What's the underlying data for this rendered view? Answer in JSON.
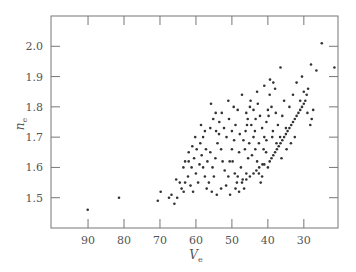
{
  "chart_data": {
    "type": "scatter",
    "title": "",
    "xlabel": "V",
    "xlabel_subscript": "e",
    "ylabel": "n",
    "ylabel_subscript": "e",
    "x_reversed": true,
    "xlim": [
      100.3,
      20.5
    ],
    "ylim": [
      1.4,
      2.1
    ],
    "x_ticks": [
      90,
      80,
      70,
      60,
      50,
      40,
      30
    ],
    "x_tick_labels": [
      "90",
      "80",
      "70",
      "60",
      "50",
      "40",
      "30"
    ],
    "y_ticks": [
      1.5,
      1.6,
      1.7,
      1.8,
      1.9,
      2.0
    ],
    "y_tick_labels": [
      "1.5",
      "1.6",
      "1.7",
      "1.8",
      "1.9",
      "2.0"
    ],
    "grid": false,
    "legend": null,
    "series": [
      {
        "name": "glasses",
        "marker_color": "#333333",
        "points": [
          [
            90.1,
            1.46
          ],
          [
            81.4,
            1.5
          ],
          [
            70.6,
            1.49
          ],
          [
            69.8,
            1.52
          ],
          [
            67.5,
            1.5
          ],
          [
            66.8,
            1.51
          ],
          [
            66.0,
            1.48
          ],
          [
            65.2,
            1.5
          ],
          [
            64.0,
            1.53
          ],
          [
            63.4,
            1.52
          ],
          [
            65.5,
            1.56
          ],
          [
            64.5,
            1.55
          ],
          [
            63.0,
            1.55
          ],
          [
            62.2,
            1.57
          ],
          [
            61.5,
            1.54
          ],
          [
            60.8,
            1.52
          ],
          [
            63.0,
            1.62
          ],
          [
            62.0,
            1.62
          ],
          [
            61.2,
            1.6
          ],
          [
            60.5,
            1.63
          ],
          [
            60.0,
            1.58
          ],
          [
            59.4,
            1.55
          ],
          [
            59.0,
            1.61
          ],
          [
            58.4,
            1.64
          ],
          [
            58.0,
            1.6
          ],
          [
            57.5,
            1.57
          ],
          [
            57.0,
            1.53
          ],
          [
            56.4,
            1.55
          ],
          [
            59.8,
            1.66
          ],
          [
            58.8,
            1.68
          ],
          [
            58.0,
            1.7
          ],
          [
            57.2,
            1.66
          ],
          [
            56.8,
            1.62
          ],
          [
            56.0,
            1.65
          ],
          [
            55.4,
            1.6
          ],
          [
            55.0,
            1.57
          ],
          [
            54.6,
            1.63
          ],
          [
            54.0,
            1.68
          ],
          [
            53.6,
            1.71
          ],
          [
            53.0,
            1.66
          ],
          [
            52.6,
            1.62
          ],
          [
            52.0,
            1.59
          ],
          [
            51.6,
            1.54
          ],
          [
            51.0,
            1.57
          ],
          [
            50.6,
            1.62
          ],
          [
            50.0,
            1.66
          ],
          [
            56.0,
            1.73
          ],
          [
            55.2,
            1.76
          ],
          [
            54.4,
            1.72
          ],
          [
            53.5,
            1.75
          ],
          [
            52.8,
            1.78
          ],
          [
            52.2,
            1.73
          ],
          [
            51.5,
            1.7
          ],
          [
            50.8,
            1.76
          ],
          [
            50.0,
            1.72
          ],
          [
            49.4,
            1.69
          ],
          [
            49.0,
            1.74
          ],
          [
            48.4,
            1.79
          ],
          [
            48.0,
            1.65
          ],
          [
            47.5,
            1.6
          ],
          [
            47.0,
            1.56
          ],
          [
            46.6,
            1.53
          ],
          [
            46.0,
            1.58
          ],
          [
            45.5,
            1.63
          ],
          [
            49.8,
            1.62
          ],
          [
            49.2,
            1.58
          ],
          [
            48.6,
            1.55
          ],
          [
            48.0,
            1.52
          ],
          [
            47.2,
            1.55
          ],
          [
            46.8,
            1.69
          ],
          [
            46.2,
            1.72
          ],
          [
            45.6,
            1.76
          ],
          [
            45.0,
            1.8
          ],
          [
            44.6,
            1.74
          ],
          [
            44.0,
            1.7
          ],
          [
            43.5,
            1.66
          ],
          [
            43.0,
            1.62
          ],
          [
            42.5,
            1.58
          ],
          [
            42.0,
            1.55
          ],
          [
            41.6,
            1.57
          ],
          [
            41.0,
            1.61
          ],
          [
            40.5,
            1.65
          ],
          [
            44.8,
            1.82
          ],
          [
            44.0,
            1.79
          ],
          [
            43.4,
            1.76
          ],
          [
            42.8,
            1.81
          ],
          [
            42.2,
            1.77
          ],
          [
            41.6,
            1.73
          ],
          [
            41.0,
            1.7
          ],
          [
            40.4,
            1.75
          ],
          [
            40.0,
            1.79
          ],
          [
            39.5,
            1.84
          ],
          [
            39.0,
            1.8
          ],
          [
            38.6,
            1.72
          ],
          [
            43.0,
            1.85
          ],
          [
            41.0,
            1.87
          ],
          [
            39.4,
            1.89
          ],
          [
            38.0,
            1.86
          ],
          [
            36.5,
            1.93
          ],
          [
            38.5,
            1.88
          ],
          [
            37.8,
            1.78
          ],
          [
            37.2,
            1.74
          ],
          [
            36.6,
            1.7
          ],
          [
            36.0,
            1.77
          ],
          [
            35.5,
            1.82
          ],
          [
            35.0,
            1.73
          ],
          [
            40.0,
            1.6
          ],
          [
            39.5,
            1.62
          ],
          [
            39.0,
            1.63
          ],
          [
            38.5,
            1.64
          ],
          [
            38.0,
            1.65
          ],
          [
            37.5,
            1.66
          ],
          [
            37.0,
            1.67
          ],
          [
            36.5,
            1.68
          ],
          [
            36.0,
            1.69
          ],
          [
            35.5,
            1.7
          ],
          [
            35.0,
            1.71
          ],
          [
            34.5,
            1.72
          ],
          [
            34.0,
            1.73
          ],
          [
            33.5,
            1.74
          ],
          [
            33.0,
            1.75
          ],
          [
            32.5,
            1.76
          ],
          [
            32.0,
            1.77
          ],
          [
            31.5,
            1.78
          ],
          [
            31.0,
            1.79
          ],
          [
            30.5,
            1.8
          ],
          [
            30.0,
            1.81
          ],
          [
            29.6,
            1.82
          ],
          [
            29.2,
            1.84
          ],
          [
            28.8,
            1.86
          ],
          [
            44.0,
            1.58
          ],
          [
            43.2,
            1.59
          ],
          [
            42.4,
            1.6
          ],
          [
            41.5,
            1.61
          ],
          [
            45.0,
            1.57
          ],
          [
            46.0,
            1.56
          ],
          [
            34.0,
            1.8
          ],
          [
            33.0,
            1.84
          ],
          [
            32.0,
            1.88
          ],
          [
            31.0,
            1.82
          ],
          [
            30.0,
            1.85
          ],
          [
            29.0,
            1.78
          ],
          [
            28.2,
            1.74
          ],
          [
            27.8,
            1.76
          ],
          [
            27.4,
            1.79
          ],
          [
            30.5,
            1.9
          ],
          [
            26.5,
            1.92
          ],
          [
            25.0,
            2.01
          ],
          [
            21.5,
            1.93
          ],
          [
            28.0,
            1.94
          ],
          [
            32.5,
            1.7
          ],
          [
            34.8,
            1.66
          ],
          [
            36.2,
            1.63
          ],
          [
            33.6,
            1.68
          ],
          [
            54.5,
            1.78
          ],
          [
            55.8,
            1.81
          ],
          [
            51.0,
            1.82
          ],
          [
            49.5,
            1.8
          ],
          [
            47.2,
            1.84
          ],
          [
            46.0,
            1.78
          ],
          [
            57.5,
            1.72
          ],
          [
            58.6,
            1.74
          ],
          [
            60.2,
            1.7
          ],
          [
            61.0,
            1.67
          ],
          [
            62.0,
            1.65
          ],
          [
            63.5,
            1.6
          ],
          [
            53.0,
            1.53
          ],
          [
            54.2,
            1.51
          ],
          [
            55.6,
            1.52
          ],
          [
            50.5,
            1.51
          ],
          [
            49.0,
            1.53
          ],
          [
            48.4,
            1.57
          ],
          [
            42.5,
            1.68
          ],
          [
            41.2,
            1.66
          ],
          [
            40.4,
            1.69
          ],
          [
            38.8,
            1.7
          ],
          [
            37.6,
            1.68
          ],
          [
            39.8,
            1.77
          ],
          [
            47.8,
            1.71
          ],
          [
            46.4,
            1.66
          ],
          [
            45.2,
            1.68
          ],
          [
            44.4,
            1.64
          ],
          [
            43.6,
            1.72
          ],
          [
            45.8,
            1.74
          ]
        ]
      }
    ]
  }
}
